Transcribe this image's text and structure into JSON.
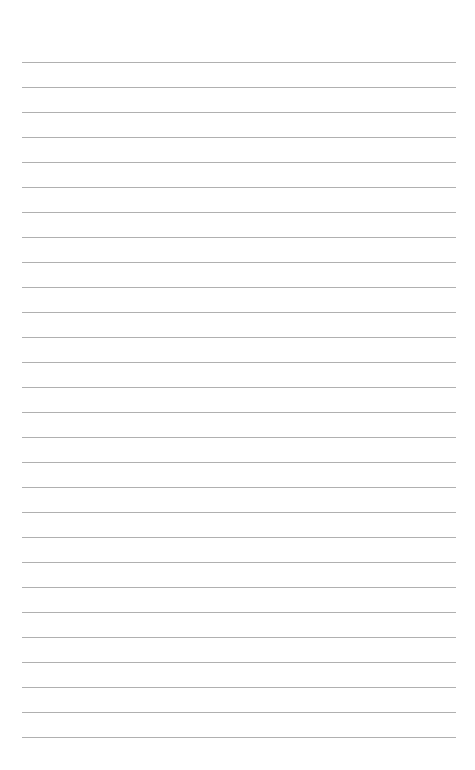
{
  "document": {
    "type": "lined-paper",
    "line_count": 28,
    "line_color": "#b0b0b0",
    "background_color": "#ffffff",
    "text": ""
  }
}
